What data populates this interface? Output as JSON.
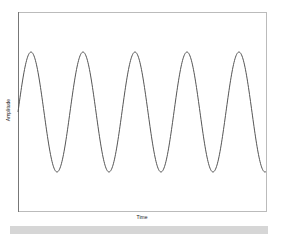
{
  "chart_data": {
    "type": "line",
    "title": "",
    "xlabel": "Time",
    "ylabel": "Amplitude",
    "grid": false,
    "legend": null,
    "series": [
      {
        "name": "sine wave",
        "function": "sin",
        "cycles": 4.77,
        "amplitude": 1,
        "phase_start": 0,
        "color": "#555555"
      }
    ],
    "ylim": [
      -1.65,
      1.65
    ],
    "x_ticks": [],
    "y_ticks": []
  },
  "layout": {
    "plot_box": {
      "x": 18,
      "y": 12,
      "w": 249,
      "h": 200
    },
    "midline_y": 112,
    "amplitude_px": 60,
    "period_px": 52
  },
  "colors": {
    "axis_left": "#777777",
    "axis_other": "#bbbbbb",
    "line": "#555555",
    "bar": "#d6d6d6"
  }
}
